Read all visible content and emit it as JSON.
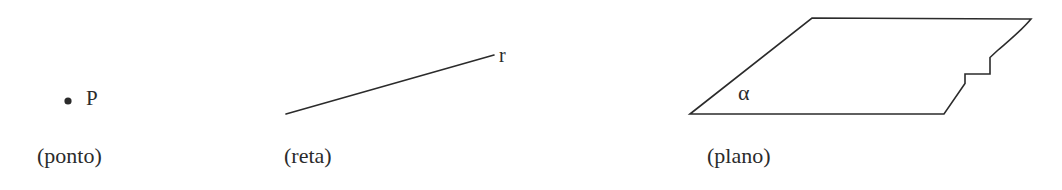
{
  "figure": {
    "background_color": "#ffffff",
    "stroke_color": "#2b2b2b",
    "stroke_width": 1.6,
    "width": 1062,
    "height": 190
  },
  "panels": [
    {
      "id": "ponto",
      "caption": "(ponto)",
      "label": "P",
      "shape": "dot",
      "dot": {
        "cx": 68,
        "cy": 101,
        "r": 3.6
      }
    },
    {
      "id": "reta",
      "caption": "(reta)",
      "label": "r",
      "shape": "line-segment",
      "line": {
        "x1": 286,
        "y1": 114,
        "x2": 494,
        "y2": 55
      }
    },
    {
      "id": "plano",
      "caption": "(plano)",
      "label": "α",
      "shape": "parallelogram-with-notch",
      "path": "M 690 114 L 812 18 L 1031 19 C 1022 30 1010 40 998 50 L 990 57 L 990 74 L 965 74 L 965 83 L 944 114 Z"
    }
  ]
}
